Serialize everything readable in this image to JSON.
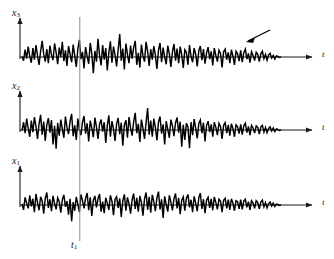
{
  "figure": {
    "kind": "ensemble-of-random-process-realizations",
    "background_color": "#ffffff",
    "trace_color": "#000000",
    "axis_color": "#1a1a1a",
    "marker_line_color": "#8a8a8a",
    "width": 334,
    "height": 259
  },
  "labels": {
    "axis_y_top": "x",
    "axis_y_top_sub": "3",
    "axis_y_mid": "x",
    "axis_y_mid_sub": "2",
    "axis_y_bot": "x",
    "axis_y_bot_sub": "1",
    "axis_t_top": "t",
    "axis_t_mid": "t",
    "axis_t_bot": "t",
    "marker_label": "t",
    "marker_label_sub": "1"
  },
  "annotations": {
    "pointer_arrow": "diagonal-pointer-arrow"
  },
  "chart_data": {
    "type": "line",
    "title": "",
    "xlabel": "t",
    "ylabel": "",
    "grid": false,
    "legend": false,
    "axis_ranges": {
      "x": [
        0,
        260
      ],
      "y": [
        -1.0,
        1.0
      ]
    },
    "marker_lines": [
      {
        "name": "t1",
        "x": 58,
        "label": "t1"
      }
    ],
    "series": [
      {
        "name": "x3",
        "label": "x",
        "sub": "3",
        "baseline_y": 57,
        "amplitude_px": 26,
        "x_start": 22,
        "x_end": 281,
        "values": [
          0.02,
          -0.14,
          0.28,
          -0.06,
          0.4,
          0.02,
          -0.22,
          0.34,
          -0.1,
          0.46,
          0.05,
          -0.3,
          0.22,
          0.62,
          0.12,
          -0.18,
          0.3,
          -0.24,
          0.44,
          0.08,
          -0.12,
          0.52,
          0.18,
          -0.28,
          0.36,
          0.0,
          0.58,
          -0.16,
          0.26,
          -0.34,
          0.42,
          0.1,
          -0.2,
          0.48,
          0.04,
          -0.38,
          0.3,
          0.66,
          -0.08,
          0.2,
          -0.44,
          0.38,
          0.02,
          -0.26,
          0.54,
          0.14,
          -0.62,
          0.24,
          -0.18,
          0.7,
          0.06,
          -0.32,
          0.46,
          -0.1,
          0.34,
          -0.52,
          0.18,
          0.6,
          -0.22,
          0.4,
          0.08,
          -0.36,
          0.28,
          0.88,
          -0.14,
          0.32,
          -0.48,
          0.52,
          0.1,
          -0.24,
          0.44,
          -0.06,
          0.36,
          0.62,
          -0.3,
          0.16,
          -0.4,
          0.48,
          0.04,
          -0.18,
          0.58,
          0.22,
          -0.34,
          0.3,
          -0.1,
          0.42,
          0.06,
          -0.46,
          0.26,
          0.54,
          -0.2,
          0.36,
          0.0,
          -0.28,
          0.44,
          0.12,
          -0.38,
          0.2,
          0.5,
          -0.14,
          0.32,
          -0.24,
          0.4,
          0.08,
          -0.42,
          0.28,
          0.18,
          -0.3,
          0.46,
          0.02,
          -0.2,
          0.34,
          0.1,
          -0.36,
          0.24,
          0.42,
          -0.12,
          0.3,
          -0.26,
          0.16,
          0.38,
          -0.08,
          0.22,
          -0.32,
          0.34,
          0.06,
          -0.18,
          0.26,
          0.14,
          -0.4,
          0.2,
          0.3,
          -0.1,
          0.18,
          -0.24,
          0.28,
          0.04,
          -0.3,
          0.22,
          0.12,
          -0.16,
          0.26,
          -0.2,
          0.16,
          0.3,
          -0.08,
          0.14,
          -0.22,
          0.2,
          0.06,
          -0.14,
          0.18,
          0.1,
          -0.18,
          0.12,
          0.22,
          -0.06,
          0.1,
          -0.12,
          0.08,
          0.14,
          -0.04,
          0.06,
          -0.08,
          0.04,
          0.02,
          -0.02,
          0.0
        ]
      },
      {
        "name": "x2",
        "label": "x",
        "sub": "2",
        "baseline_y": 130,
        "amplitude_px": 26,
        "x_start": 22,
        "x_end": 281,
        "values": [
          -0.02,
          0.3,
          -0.12,
          0.44,
          0.06,
          -0.26,
          0.36,
          -0.08,
          0.5,
          0.14,
          -0.34,
          0.24,
          0.58,
          -0.18,
          0.32,
          -0.42,
          0.2,
          0.46,
          -0.1,
          0.38,
          -0.56,
          0.16,
          -0.72,
          0.28,
          -0.22,
          0.4,
          0.04,
          -0.3,
          0.52,
          0.1,
          -0.16,
          0.34,
          0.62,
          -0.24,
          0.18,
          -0.38,
          0.44,
          0.02,
          -0.2,
          0.3,
          0.54,
          -0.14,
          0.26,
          -0.44,
          0.36,
          0.08,
          -0.28,
          0.48,
          0.12,
          -0.34,
          0.22,
          0.4,
          -0.06,
          0.3,
          -0.5,
          0.18,
          0.56,
          -0.26,
          0.34,
          0.04,
          -0.42,
          0.24,
          0.46,
          -0.16,
          0.28,
          -0.6,
          0.2,
          0.38,
          -0.3,
          0.5,
          0.08,
          -0.22,
          0.32,
          0.66,
          -0.12,
          0.24,
          -0.46,
          0.4,
          0.06,
          -0.34,
          0.28,
          0.84,
          -0.18,
          0.36,
          -0.26,
          0.44,
          0.1,
          -0.4,
          0.3,
          0.52,
          -0.14,
          0.22,
          -0.56,
          0.34,
          0.02,
          -0.3,
          0.4,
          0.16,
          -0.24,
          0.28,
          0.48,
          -0.1,
          0.32,
          -0.64,
          0.2,
          -0.38,
          0.26,
          0.12,
          -0.7,
          0.3,
          -0.2,
          0.42,
          0.06,
          -0.32,
          0.24,
          0.38,
          -0.12,
          0.28,
          -0.44,
          0.18,
          0.34,
          -0.08,
          0.22,
          -0.26,
          0.3,
          0.1,
          -0.2,
          0.26,
          0.14,
          -0.34,
          0.18,
          0.28,
          -0.12,
          0.2,
          -0.22,
          0.24,
          0.06,
          -0.26,
          0.2,
          0.12,
          -0.14,
          0.22,
          -0.18,
          0.16,
          0.26,
          -0.1,
          0.14,
          -0.2,
          0.18,
          0.08,
          -0.12,
          0.16,
          0.1,
          -0.16,
          0.12,
          0.18,
          -0.08,
          0.1,
          -0.1,
          0.06,
          0.12,
          -0.04,
          0.08,
          -0.06,
          0.04,
          0.02,
          -0.02,
          0.0
        ]
      },
      {
        "name": "x1",
        "label": "x",
        "sub": "1",
        "baseline_y": 205,
        "amplitude_px": 24,
        "x_start": 22,
        "x_end": 281,
        "values": [
          0.04,
          -0.2,
          0.32,
          0.08,
          -0.14,
          0.4,
          -0.06,
          0.26,
          -0.3,
          0.46,
          0.1,
          -0.22,
          0.34,
          0.18,
          -0.36,
          0.28,
          0.52,
          -0.12,
          0.24,
          -0.26,
          0.38,
          0.06,
          -0.18,
          0.3,
          0.14,
          -0.32,
          0.22,
          0.42,
          -0.08,
          0.16,
          -0.4,
          0.26,
          -0.68,
          0.12,
          -0.24,
          0.34,
          0.04,
          -0.3,
          0.44,
          0.18,
          -0.14,
          0.28,
          0.5,
          -0.22,
          0.32,
          -0.46,
          0.2,
          0.38,
          -0.1,
          0.26,
          0.46,
          -0.28,
          0.14,
          -0.34,
          0.3,
          0.08,
          -0.2,
          0.4,
          0.16,
          -0.42,
          0.24,
          0.34,
          -0.12,
          0.28,
          -0.5,
          0.18,
          0.44,
          -0.24,
          0.32,
          0.06,
          -0.36,
          0.22,
          0.48,
          -0.16,
          0.3,
          -0.28,
          0.38,
          0.1,
          -0.44,
          0.26,
          0.52,
          -0.2,
          0.34,
          -0.32,
          0.42,
          0.14,
          -0.26,
          0.3,
          0.56,
          -0.18,
          0.24,
          -0.54,
          0.36,
          0.02,
          -0.28,
          0.4,
          0.12,
          -0.22,
          0.26,
          0.48,
          -0.14,
          0.3,
          -0.38,
          0.2,
          0.34,
          -0.24,
          0.28,
          0.44,
          -0.1,
          0.22,
          -0.3,
          0.36,
          0.08,
          -0.26,
          0.3,
          0.5,
          -0.16,
          0.24,
          -0.34,
          0.2,
          0.32,
          -0.12,
          0.26,
          -0.22,
          0.34,
          0.1,
          -0.18,
          0.24,
          0.16,
          -0.3,
          0.2,
          0.28,
          -0.14,
          0.22,
          -0.2,
          0.26,
          0.08,
          -0.24,
          0.18,
          0.14,
          -0.16,
          0.22,
          -0.18,
          0.16,
          0.24,
          -0.1,
          0.14,
          -0.2,
          0.18,
          0.08,
          -0.14,
          0.18,
          0.1,
          -0.16,
          0.12,
          0.2,
          -0.08,
          0.1,
          -0.12,
          0.06,
          0.12,
          -0.04,
          0.08,
          -0.06,
          0.04,
          0.02,
          -0.02,
          0.0
        ]
      }
    ]
  }
}
